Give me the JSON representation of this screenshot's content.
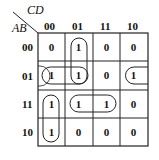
{
  "kmap": {
    "col_var": "CD",
    "row_var": "AB",
    "col_labels": [
      "00",
      "01",
      "11",
      "10"
    ],
    "row_labels": [
      "00",
      "01",
      "11",
      "10"
    ],
    "cells": [
      [
        "0",
        "1",
        "0",
        "0"
      ],
      [
        "1",
        "1",
        "0",
        "1"
      ],
      [
        "1",
        "1",
        "1",
        "0"
      ],
      [
        "1",
        "0",
        "0",
        "0"
      ]
    ],
    "groups": [
      {
        "name": "col01-rows00-01",
        "cells": [
          [
            0,
            1
          ],
          [
            1,
            1
          ]
        ]
      },
      {
        "name": "row01-cols00-01",
        "cells": [
          [
            1,
            0
          ],
          [
            1,
            1
          ]
        ]
      },
      {
        "name": "col00-rows11-10",
        "cells": [
          [
            2,
            0
          ],
          [
            3,
            0
          ]
        ]
      },
      {
        "name": "row11-cols01-11",
        "cells": [
          [
            2,
            1
          ],
          [
            2,
            2
          ]
        ]
      },
      {
        "name": "row01-wrap-cols10-00",
        "cells": [
          [
            1,
            3
          ],
          [
            1,
            0
          ]
        ]
      }
    ]
  }
}
